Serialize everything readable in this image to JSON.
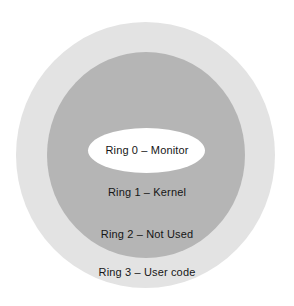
{
  "diagram": {
    "background_color": "#ffffff",
    "rings": [
      {
        "id": "ring-3",
        "label": "Ring 3 – User code",
        "color": "#e3e3e3",
        "level": 3,
        "shape": "circle",
        "position": "outermost"
      },
      {
        "id": "ring-2",
        "label": "Ring 2 – Not Used",
        "color": "#b5b5b5",
        "level": 2,
        "shape": "circle",
        "position": "middle-outer"
      },
      {
        "id": "ring-1",
        "label": "Ring 1 – Kernel",
        "color": "#b5b5b5",
        "level": 1,
        "shape": "circle",
        "position": "middle-inner"
      },
      {
        "id": "ring-0",
        "label": "Ring 0 – Monitor",
        "color": "#ffffff",
        "level": 0,
        "shape": "ellipse",
        "position": "innermost"
      }
    ],
    "text_color": "#161616"
  }
}
